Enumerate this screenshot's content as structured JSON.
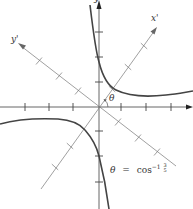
{
  "figure": {
    "axes": {
      "x_label": "x",
      "y_label": "y",
      "x_prime_label": "x'",
      "y_prime_label": "y'"
    },
    "angle_label": "θ",
    "equation": {
      "lhs": "θ",
      "equals": "=",
      "func": "cos",
      "exponent": "−1",
      "numerator": "3",
      "denominator": "5"
    },
    "colors": {
      "axis": "#555555",
      "rotated_axis": "#777777",
      "curve": "#444444",
      "text": "#333333"
    },
    "geometry": {
      "origin": [
        99,
        107
      ],
      "tick_spacing_px": 24.5,
      "rotation_angle_deg": 53.13
    }
  }
}
